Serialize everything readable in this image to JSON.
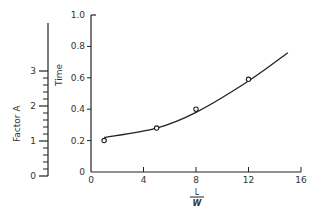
{
  "chart_data": {
    "type": "line",
    "title": "",
    "xlabel": "L/W",
    "xlabel_numerator": "L",
    "xlabel_denominator": "W",
    "ylabel": "Time",
    "secondary_ylabel": "Factor A",
    "xlim": [
      0,
      16
    ],
    "ylim": [
      0,
      1.0
    ],
    "secondary_ylim": [
      0,
      3
    ],
    "x_ticks": [
      "0",
      "4",
      "8",
      "12",
      "16"
    ],
    "y_ticks": [
      "0",
      "0.2",
      "0.4",
      "0.6",
      "0.8",
      "1.0"
    ],
    "secondary_y_ticks": [
      "0",
      "1",
      "2",
      "3"
    ],
    "grid": false,
    "legend": null,
    "series": [
      {
        "name": "observed",
        "style": "open-circle markers",
        "x": [
          1,
          5,
          8,
          12
        ],
        "y": [
          0.2,
          0.28,
          0.4,
          0.59
        ]
      },
      {
        "name": "fitted curve",
        "style": "smooth line",
        "x": [
          1,
          5,
          8,
          12,
          15
        ],
        "y": [
          0.22,
          0.28,
          0.38,
          0.58,
          0.76
        ]
      }
    ]
  }
}
